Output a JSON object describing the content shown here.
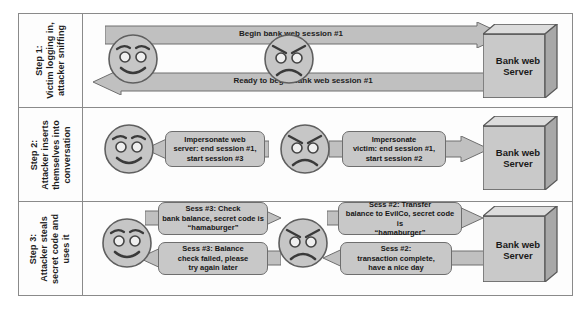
{
  "diagram": {
    "colors": {
      "fill_gray": "#c8c8c8",
      "arrow_fill": "#c0c0c0",
      "stroke": "#6e6e6e",
      "frame_border": "#8a8a8a",
      "text": "#1a1a1a",
      "server_side": "#a9a9a9",
      "server_top": "#d5d5d5"
    },
    "actors": {
      "victim": "victim-smiley-face",
      "attacker": "attacker-angry-face",
      "server_label_line1": "Bank web",
      "server_label_line2": "Server"
    },
    "steps": [
      {
        "id": "step-1",
        "label": "Step 1:\nVictim logging in,\nattacker sniffing",
        "label_lines": [
          "Step 1:",
          "Victim logging in,",
          "attacker sniffing"
        ],
        "messages": [
          {
            "id": "s1-m1",
            "direction": "right",
            "from": "victim",
            "to": "server",
            "style": "banner",
            "lines": [
              "Begin bank web session #1"
            ]
          },
          {
            "id": "s1-m2",
            "direction": "left",
            "from": "server",
            "to": "victim",
            "style": "banner",
            "lines": [
              "Ready to begin bank web session #1"
            ]
          }
        ]
      },
      {
        "id": "step-2",
        "label": "Step 2:\nAttacker inserts\nthemselves into\nconversation",
        "label_lines": [
          "Step 2:",
          "Attacker inserts",
          "themselves into",
          "conversation"
        ],
        "messages": [
          {
            "id": "s2-m1",
            "direction": "left",
            "from": "attacker",
            "to": "victim",
            "style": "box",
            "lines": [
              "Impersonate web",
              "server: end session #1,",
              "start session #3"
            ]
          },
          {
            "id": "s2-m2",
            "direction": "right",
            "from": "attacker",
            "to": "server",
            "style": "box",
            "lines": [
              "Impersonate",
              "victim: end session #1,",
              "start session #2"
            ]
          }
        ]
      },
      {
        "id": "step-3",
        "label": "Step 3:\nAttacker steals\nsecret code and\nuses it",
        "label_lines": [
          "Step 3:",
          "Attacker steals",
          "secret code and",
          "uses it"
        ],
        "messages": [
          {
            "id": "s3-m1",
            "direction": "right",
            "from": "victim",
            "to": "attacker",
            "style": "box",
            "lines": [
              "Sess #3: Check",
              "bank balance, secret code is",
              "“hamaburger”"
            ]
          },
          {
            "id": "s3-m2",
            "direction": "right",
            "from": "attacker",
            "to": "server",
            "style": "box",
            "lines": [
              "Sess #2: Transfer",
              "balance to EvilCo, secret code is",
              "“hamaburger”"
            ]
          },
          {
            "id": "s3-m3",
            "direction": "left",
            "from": "attacker",
            "to": "victim",
            "style": "box",
            "lines": [
              "Sess #3: Balance",
              "check failed, please",
              "try again later"
            ]
          },
          {
            "id": "s3-m4",
            "direction": "left",
            "from": "server",
            "to": "attacker",
            "style": "box",
            "lines": [
              "Sess #2:",
              "transaction complete,",
              "have a nice day"
            ]
          }
        ]
      }
    ]
  }
}
